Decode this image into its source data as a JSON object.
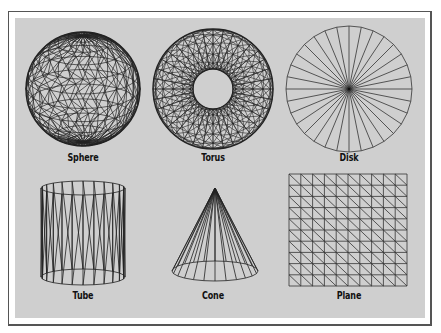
{
  "figure": {
    "colors": {
      "panel": "#cfcfcf",
      "line": "#1a1a1a",
      "frame": "#555555"
    },
    "shapes": [
      {
        "id": "sphere",
        "label": "Sphere"
      },
      {
        "id": "torus",
        "label": "Torus"
      },
      {
        "id": "disk",
        "label": "Disk"
      },
      {
        "id": "tube",
        "label": "Tube"
      },
      {
        "id": "cone",
        "label": "Cone"
      },
      {
        "id": "plane",
        "label": "Plane"
      }
    ]
  }
}
